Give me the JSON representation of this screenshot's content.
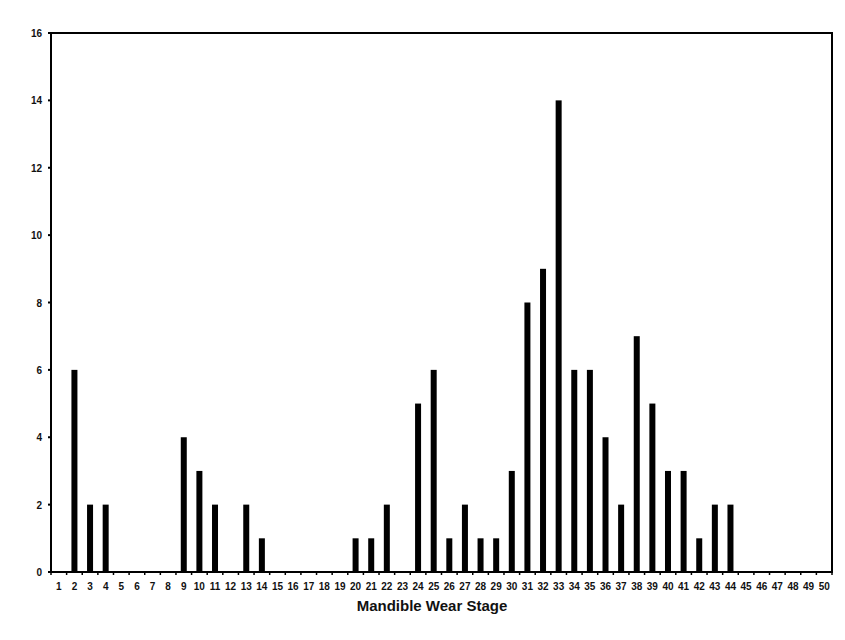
{
  "chart_data": {
    "type": "bar",
    "title": "",
    "xlabel": "Mandible Wear Stage",
    "ylabel": "",
    "ylim": [
      0,
      16
    ],
    "yticks": [
      0,
      2,
      4,
      6,
      8,
      10,
      12,
      14,
      16
    ],
    "grid": false,
    "legend": null,
    "bar_color": "#000000",
    "categories": [
      "1",
      "2",
      "3",
      "4",
      "5",
      "6",
      "7",
      "8",
      "9",
      "10",
      "11",
      "12",
      "13",
      "14",
      "15",
      "16",
      "17",
      "18",
      "19",
      "20",
      "21",
      "22",
      "23",
      "24",
      "25",
      "26",
      "27",
      "28",
      "29",
      "30",
      "31",
      "32",
      "33",
      "34",
      "35",
      "36",
      "37",
      "38",
      "39",
      "40",
      "41",
      "42",
      "43",
      "44",
      "45",
      "46",
      "47",
      "48",
      "49",
      "50"
    ],
    "values": [
      0,
      6,
      2,
      2,
      0,
      0,
      0,
      0,
      4,
      3,
      2,
      0,
      2,
      1,
      0,
      0,
      0,
      0,
      0,
      1,
      1,
      2,
      0,
      5,
      6,
      1,
      2,
      1,
      1,
      3,
      8,
      9,
      14,
      6,
      6,
      4,
      2,
      7,
      5,
      3,
      3,
      1,
      2,
      2,
      0,
      0,
      0,
      0,
      0,
      0
    ]
  }
}
